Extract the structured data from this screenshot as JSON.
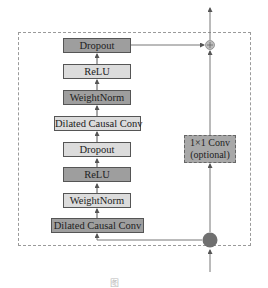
{
  "diagram": {
    "left_stack": [
      {
        "label": "Dropout",
        "shade": "dark"
      },
      {
        "label": "ReLU",
        "shade": "light"
      },
      {
        "label": "WeightNorm",
        "shade": "dark"
      },
      {
        "label": "Dilated Causal Conv",
        "shade": "light"
      },
      {
        "label": "Dropout",
        "shade": "light"
      },
      {
        "label": "ReLU",
        "shade": "dark"
      },
      {
        "label": "WeightNorm",
        "shade": "light"
      },
      {
        "label": "Dilated Causal Conv",
        "shade": "dark"
      }
    ],
    "skip_branch": {
      "line1": "1×1 Conv",
      "line2": "(optional)"
    },
    "add_node": "⊕",
    "caption": "图"
  },
  "colors": {
    "dark_block": "#9e9e9e",
    "light_block": "#dcdcdc",
    "border": "#555555",
    "line": "#777777",
    "dashed_frame": "#9a9a9a",
    "split_node": "#777777"
  }
}
